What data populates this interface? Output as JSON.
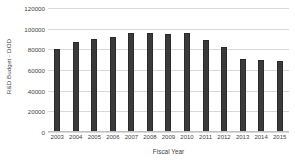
{
  "chart_data": {
    "type": "bar",
    "title": "",
    "xlabel": "Fiscal Year",
    "ylabel": "R&D Budget - DOD",
    "categories": [
      "2003",
      "2004",
      "2005",
      "2006",
      "2007",
      "2008",
      "2009",
      "2010",
      "2011",
      "2012",
      "2013",
      "2014",
      "2015"
    ],
    "values": [
      80000,
      87000,
      90000,
      92000,
      95500,
      96000,
      95000,
      96000,
      89000,
      82000,
      70500,
      70000,
      69000
    ],
    "series": [
      {
        "name": "R&D Budget - DOD",
        "values": [
          80000,
          87000,
          90000,
          92000,
          95500,
          96000,
          95000,
          96000,
          89000,
          82000,
          70500,
          70000,
          69000
        ]
      }
    ],
    "ylim": [
      0,
      120000
    ],
    "yticks": [
      0,
      20000,
      40000,
      60000,
      80000,
      100000,
      120000
    ],
    "ytick_labels": [
      "0",
      "20000",
      "40000",
      "60000",
      "80000",
      "100000",
      "120000"
    ],
    "grid": true,
    "legend": false,
    "bar_color": "#3a3a3a",
    "gridline_color": "#d9d9d9",
    "background_color": "#ffffff"
  }
}
